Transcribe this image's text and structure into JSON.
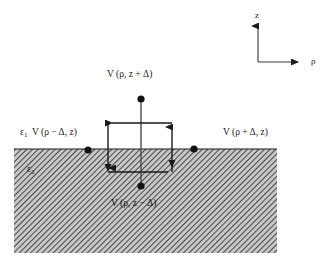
{
  "figure": {
    "background_color": "#ffffff",
    "line_color": "#1a1a1a",
    "hatch_color": "#555555",
    "hatch_background": "#c8c8c8"
  },
  "axes": {
    "vertical_label": "z",
    "horizontal_label": "ρ",
    "origin": {
      "x": 258,
      "y": 62
    },
    "vertical_tip": {
      "x": 258,
      "y": 22
    },
    "horizontal_tip": {
      "x": 302,
      "y": 62
    }
  },
  "media": {
    "upper_label": "ε",
    "upper_subscript": "1",
    "lower_label": "ε",
    "lower_subscript": "2"
  },
  "nodes": {
    "top": {
      "label": "V (ρ, z + Δ)",
      "point": {
        "x": 141,
        "y": 99
      },
      "label_pos": {
        "x": 107,
        "y": 72
      }
    },
    "bottom": {
      "label": "V (ρ, z − Δ)",
      "point": {
        "x": 141,
        "y": 186
      },
      "label_pos": {
        "x": 111,
        "y": 200
      }
    },
    "left": {
      "label": "V (ρ − Δ, z)",
      "point": {
        "x": 88,
        "y": 150
      },
      "label_pos": {
        "x": 32,
        "y": 130
      }
    },
    "right": {
      "label": "V (ρ + Δ, z)",
      "point": {
        "x": 194,
        "y": 149
      },
      "label_pos": {
        "x": 223,
        "y": 130
      }
    }
  },
  "interface": {
    "y": 149,
    "x_start": 14,
    "x_end": 277
  },
  "hatched_region": {
    "x": 14,
    "y": 149,
    "width": 263,
    "height": 104
  },
  "contour": {
    "left": 108,
    "right": 172,
    "top": 123,
    "bottom": 172,
    "arrow_top_left": "left",
    "arrow_top_right": "up",
    "arrow_bottom_left": "down",
    "arrow_bottom_right": "down"
  },
  "stencil_line": {
    "x": 141,
    "y_top": 99,
    "y_bottom": 186
  }
}
